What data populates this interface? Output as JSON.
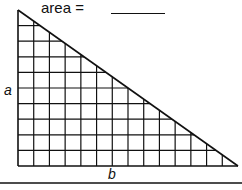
{
  "title": "area =",
  "labels": {
    "height": "a",
    "base": "b"
  },
  "grid": {
    "columns": 14,
    "rows": 10
  },
  "colors": {
    "stroke": "#111111",
    "background": "#ffffff"
  }
}
